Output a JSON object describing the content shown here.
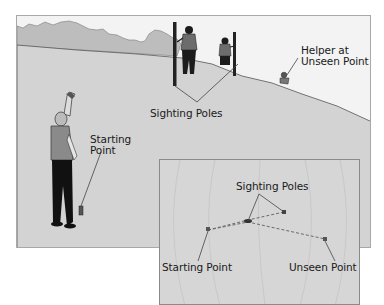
{
  "figure": {
    "main_scene": {
      "labels": {
        "sighting_poles": "Sighting Poles",
        "helper_line1": "Helper at",
        "helper_line2": "Unseen Point",
        "starting_line1": "Starting",
        "starting_line2": "Point"
      }
    },
    "inset_map": {
      "labels": {
        "sighting_poles": "Sighting Poles",
        "starting_point": "Starting Point",
        "unseen_point": "Unseen Point"
      }
    },
    "colors": {
      "ground": "#d3d3d3",
      "sky": "#f2f2f2",
      "treeline": "#bdbdbd",
      "figure_dark": "#1c1c1c",
      "leader_line": "#444444",
      "dashed_path": "#6a6a6a"
    }
  }
}
